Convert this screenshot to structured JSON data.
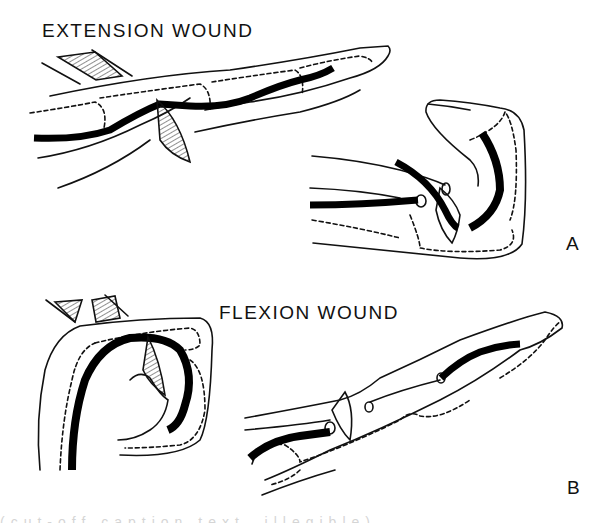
{
  "figure": {
    "panel_a": {
      "title": "EXTENSION WOUND",
      "letter": "A",
      "description": "Finger extended with laceration over tendon; flexed view shows retracted tendon ends"
    },
    "panel_b": {
      "title": "FLEXION WOUND",
      "letter": "B",
      "description": "Finger flexed with laceration; extended view shows tendon ends displaced from wound"
    },
    "caption_fragment": "(cut-off caption text, illegible)"
  },
  "colors": {
    "ink": "#111111",
    "background": "#ffffff",
    "tendon": "#000000"
  }
}
